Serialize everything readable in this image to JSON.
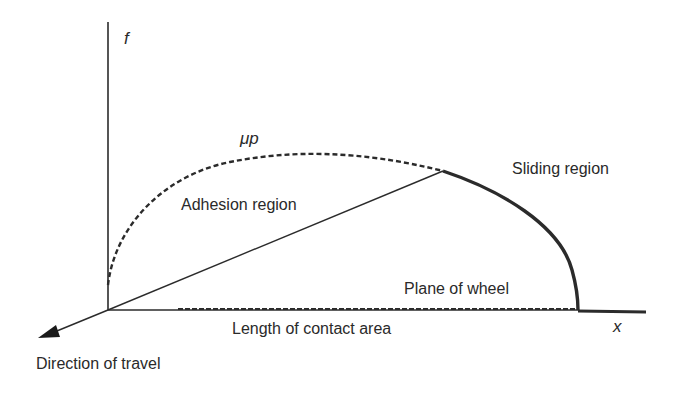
{
  "diagram": {
    "axes": {
      "y_label": "f",
      "x_label": "x"
    },
    "curves": {
      "limit_curve_label": "μp",
      "adhesion_label": "Adhesion region",
      "sliding_label": "Sliding region"
    },
    "annotations": {
      "plane_label": "Plane of wheel",
      "contact_length_label": "Length of contact area",
      "travel_label": "Direction of travel"
    },
    "colors": {
      "line": "#2b2b2b",
      "background": "#ffffff"
    }
  }
}
